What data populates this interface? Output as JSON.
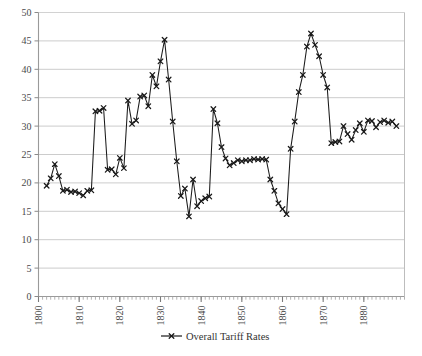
{
  "chart_data": {
    "type": "line",
    "title": "",
    "subtitle": "",
    "xlabel": "",
    "ylabel": "",
    "xlim": [
      1800,
      1890
    ],
    "ylim": [
      0,
      50
    ],
    "ytick_step": 5,
    "yticks": [
      0,
      5,
      10,
      15,
      20,
      25,
      30,
      35,
      40,
      45,
      50
    ],
    "xticks": [
      1800,
      1810,
      1820,
      1830,
      1840,
      1850,
      1860,
      1870,
      1880
    ],
    "xtick_labels": [
      "1800",
      "1810",
      "1820",
      "1830",
      "1840",
      "1850",
      "1860",
      "1870",
      "1880"
    ],
    "xtick_rotation": 90,
    "xtick_minor_step": 1,
    "grid": "horizontal",
    "grid_color": "#cccccc",
    "legend": {
      "position": "bottom-center",
      "entries": [
        {
          "name": "Overall Tariff Rates",
          "marker": "x",
          "color": "#1a1a1a",
          "line_style": "solid"
        }
      ]
    },
    "series": [
      {
        "name": "Overall Tariff Rates",
        "color": "#1a1a1a",
        "marker": "x",
        "x": [
          1802,
          1803,
          1804,
          1805,
          1806,
          1807,
          1808,
          1809,
          1810,
          1811,
          1812,
          1813,
          1814,
          1815,
          1816,
          1817,
          1818,
          1819,
          1820,
          1821,
          1822,
          1823,
          1824,
          1825,
          1826,
          1827,
          1828,
          1829,
          1830,
          1831,
          1832,
          1833,
          1834,
          1835,
          1836,
          1837,
          1838,
          1839,
          1840,
          1841,
          1842,
          1843,
          1844,
          1845,
          1846,
          1847,
          1848,
          1849,
          1850,
          1851,
          1852,
          1853,
          1854,
          1855,
          1856,
          1857,
          1858,
          1859,
          1860,
          1861,
          1862,
          1863,
          1864,
          1865,
          1866,
          1867,
          1868,
          1869,
          1870,
          1871,
          1872,
          1873,
          1874,
          1875,
          1876,
          1877,
          1878,
          1879,
          1880,
          1881,
          1882,
          1883,
          1884,
          1885,
          1886,
          1887,
          1888
        ],
        "values": [
          19.5,
          20.8,
          23.3,
          21.2,
          18.6,
          18.8,
          18.4,
          18.5,
          18.2,
          17.8,
          18.6,
          18.7,
          32.6,
          32.7,
          33.2,
          22.3,
          22.4,
          21.5,
          24.4,
          22.6,
          34.5,
          30.4,
          31.0,
          35.2,
          35.4,
          33.5,
          39.0,
          37.0,
          41.4,
          45.2,
          38.2,
          30.8,
          23.8,
          17.7,
          19.0,
          14.1,
          20.6,
          15.9,
          16.8,
          17.3,
          17.6,
          33.0,
          30.5,
          26.3,
          24.3,
          23.1,
          23.5,
          24.0,
          23.8,
          24.0,
          24.0,
          24.2,
          24.1,
          24.2,
          24.1,
          20.6,
          18.6,
          16.4,
          15.4,
          14.5,
          26.0,
          30.8,
          36.0,
          39.0,
          44.0,
          46.3,
          44.3,
          42.3,
          39.0,
          36.8,
          27.0,
          27.2,
          27.3,
          30.0,
          28.6,
          27.6,
          29.3,
          30.5,
          29.0,
          31.0,
          30.9,
          29.8,
          30.7,
          31.0,
          30.6,
          30.8,
          30.0
        ]
      }
    ]
  }
}
